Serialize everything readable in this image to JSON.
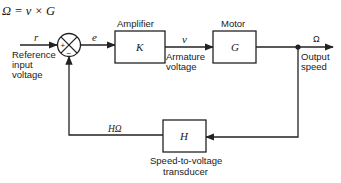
{
  "equation": "Ω = v × G",
  "input": {
    "signal": "r",
    "label_lines": [
      "Reference",
      "input",
      "voltage"
    ]
  },
  "summing_junction": {
    "plus": "+",
    "minus": "−"
  },
  "error_signal": "e",
  "blocks": {
    "amplifier": {
      "title": "Amplifier",
      "symbol": "K"
    },
    "motor": {
      "title": "Motor",
      "symbol": "G"
    },
    "transducer": {
      "symbol": "H",
      "label_lines": [
        "Speed-to-voltage",
        "transducer"
      ]
    }
  },
  "armature": {
    "signal": "v",
    "label_lines": [
      "Armature",
      "voltage"
    ]
  },
  "output": {
    "signal": "Ω",
    "label_lines": [
      "Output",
      "speed"
    ]
  },
  "feedback_signal": "HΩ",
  "colors": {
    "stroke": "#222222",
    "background": "#ffffff",
    "text": "#1a1a1a"
  }
}
